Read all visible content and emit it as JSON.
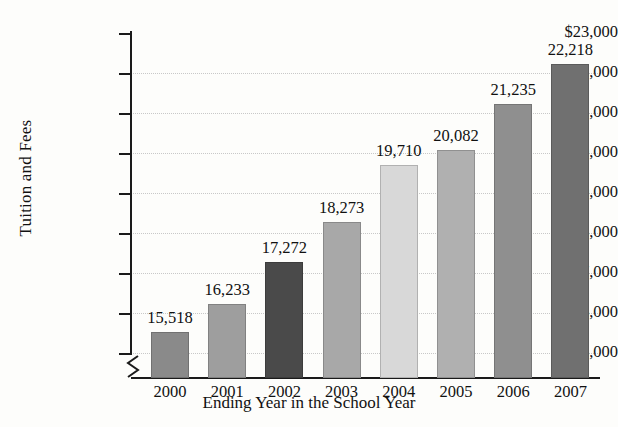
{
  "chart_data": {
    "type": "bar",
    "title": "",
    "xlabel": "Ending Year in the School Year",
    "ylabel": "Tuition and Fees",
    "categories": [
      "2000",
      "2001",
      "2002",
      "2003",
      "2004",
      "2005",
      "2006",
      "2007"
    ],
    "values": [
      15518,
      16233,
      17272,
      18273,
      19710,
      20082,
      21235,
      22218
    ],
    "value_labels": [
      "15,518",
      "16,233",
      "17,272",
      "18,273",
      "19,710",
      "20,082",
      "21,235",
      "22,218"
    ],
    "bar_colors": [
      "#8a8a8a",
      "#9e9e9e",
      "#4a4a4a",
      "#a8a8a8",
      "#d8d8d8",
      "#b0b0b0",
      "#8f8f8f",
      "#707070"
    ],
    "ylim": [
      15000,
      23000
    ],
    "ytick_values": [
      15000,
      16000,
      17000,
      18000,
      19000,
      20000,
      21000,
      22000,
      23000
    ],
    "ytick_labels": [
      "$15,000",
      "$16,000",
      "$17,000",
      "$18,000",
      "$19,000",
      "$20,000",
      "$21,000",
      "$22,000",
      "$23,000"
    ],
    "grid": true,
    "grid_style": "dotted-horizontal",
    "legend": "none",
    "axis_break": true,
    "axis_break_note": "y-axis broken below $15,000",
    "background_color": "#fdfdfb",
    "axis_color": "#1a1a1a",
    "grid_color": "#c8c8c8"
  }
}
